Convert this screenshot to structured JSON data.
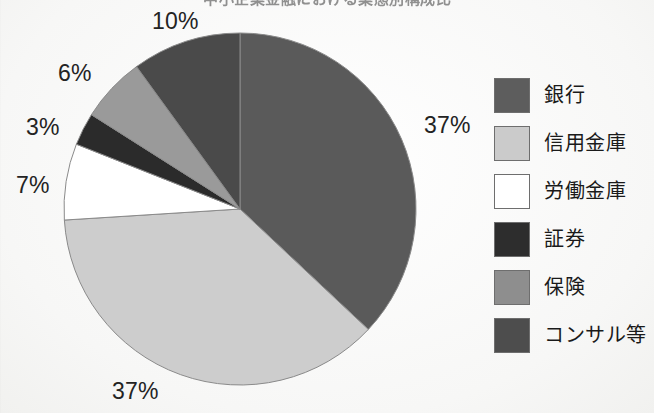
{
  "figure": {
    "title_partial": "中小企業金融における業態別構成比",
    "background_color": "#fbfbfa",
    "text_color": "#232323"
  },
  "chart_data": {
    "type": "pie",
    "title": "",
    "xlabel": "",
    "ylabel": "",
    "units": "%",
    "start_angle_deg": 0,
    "direction": "clockwise",
    "legend_position": "right",
    "grid": false,
    "categories": [
      "銀行",
      "信用金庫",
      "労働金庫",
      "証券",
      "保険",
      "コンサル等"
    ],
    "values": [
      37,
      37,
      7,
      3,
      6,
      10
    ],
    "value_labels": [
      "37%",
      "37%",
      "7%",
      "3%",
      "6%",
      "10%"
    ],
    "colors": [
      "#5a5a5a",
      "#cdcdcd",
      "#ffffff",
      "#2b2b2b",
      "#9a9a9a",
      "#4a4a4a"
    ]
  },
  "pie": {
    "center_x": 240,
    "center_y": 209,
    "radius": 176,
    "outline_color": "#8a8a8a",
    "slices": [
      {
        "name": "銀行",
        "value": 37,
        "label": "37%",
        "color": "#5a5a5a"
      },
      {
        "name": "信用金庫",
        "value": 37,
        "label": "37%",
        "color": "#cdcdcd"
      },
      {
        "name": "労働金庫",
        "value": 7,
        "label": "7%",
        "color": "#ffffff"
      },
      {
        "name": "証券",
        "value": 3,
        "label": "3%",
        "color": "#2b2b2b"
      },
      {
        "name": "保険",
        "value": 6,
        "label": "6%",
        "color": "#9a9a9a"
      },
      {
        "name": "コンサル等",
        "value": 10,
        "label": "10%",
        "color": "#4a4a4a"
      }
    ]
  },
  "labels": {
    "bank_pct": "37%",
    "shinkin_pct": "37%",
    "rodo_pct": "7%",
    "securities_pct": "3%",
    "insurance_pct": "6%",
    "consulting_pct": "10%"
  },
  "legend": {
    "items": [
      {
        "label": "銀行",
        "color": "#5d5d5d"
      },
      {
        "label": "信用金庫",
        "color": "#cbcbcb"
      },
      {
        "label": "労働金庫",
        "color": "#ffffff"
      },
      {
        "label": "証券",
        "color": "#2d2d2d"
      },
      {
        "label": "保険",
        "color": "#8e8e8e"
      },
      {
        "label": "コンサル等",
        "color": "#4d4d4d"
      }
    ]
  }
}
